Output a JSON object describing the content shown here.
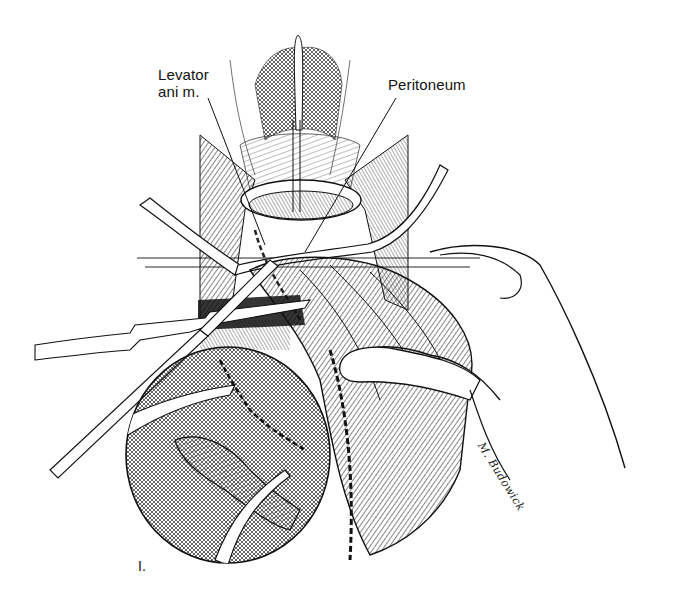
{
  "figure": {
    "labels": {
      "levator_line1": "Levator",
      "levator_line2": "ani m.",
      "peritoneum": "Peritoneum",
      "figure_number": "I."
    },
    "signature": "M. Budowick",
    "colors": {
      "ink": "#111111",
      "background": "#ffffff",
      "hatch": "#333333"
    }
  }
}
